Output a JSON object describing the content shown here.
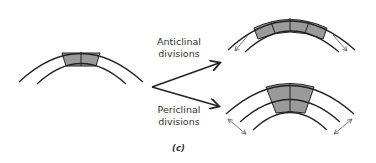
{
  "labels": {
    "anticlinal_line1": "Anticlinal",
    "anticlinal_line2": "divisions",
    "periclinal_line1": "Periclinal",
    "periclinal_line2": "divisions",
    "caption": "(c)"
  },
  "colors": {
    "cell_fill": "#9a9a9a",
    "stroke": "#222222",
    "arrow_thin": "#666666"
  },
  "diagrams": [
    {
      "name": "initial-tissue",
      "cells": 2,
      "layers": 1
    },
    {
      "name": "anticlinal-result",
      "cells": 4,
      "layers": 1
    },
    {
      "name": "periclinal-result",
      "cells": 2,
      "layers": 2
    }
  ]
}
